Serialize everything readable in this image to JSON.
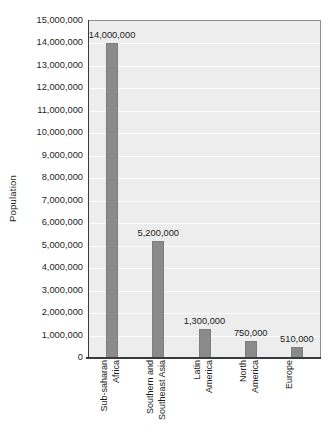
{
  "chart_data": {
    "type": "bar",
    "title": "",
    "xlabel": "",
    "ylabel": "Population",
    "categories": [
      "Sub-saharan\nAfrica",
      "Southern and\nSoutheast Asia",
      "Latin\nAmerica",
      "North\nAmerica",
      "Europe"
    ],
    "values": [
      14000000,
      5200000,
      1300000,
      750000,
      510000
    ],
    "data_labels": [
      "14,000,000",
      "5,200,000",
      "1,300,000",
      "750,000",
      "510,000"
    ],
    "ylim": [
      0,
      15000000
    ],
    "ytick_step": 1000000,
    "ytick_labels": [
      "15,000,000",
      "14,000,000",
      "13,000,000",
      "12,000,000",
      "11,000,000",
      "10,000,000",
      "9,000,000",
      "8,000,000",
      "7,000,000",
      "6,000,000",
      "5,000,000",
      "4,000,000",
      "3,000,000",
      "2,000,000",
      "1,000,000",
      "0"
    ],
    "grid": true,
    "legend": "none",
    "colors": {
      "bar": "#8a8a8a",
      "bar_border": "#7e7e7e",
      "plot_background": "#ededed",
      "gridline": "#fdfdfd",
      "axis": "#3a3a3a",
      "text": "#1c1c1c",
      "page_background": "#ffffff"
    }
  }
}
